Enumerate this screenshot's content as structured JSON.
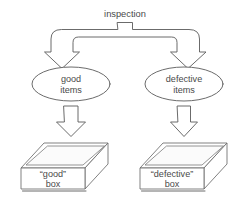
{
  "diagram": {
    "title": "inspection",
    "type": "flow-diagram",
    "colors": {
      "stroke": "#5a5a5a",
      "text": "#4a4a4a",
      "background": "#ffffff"
    },
    "source_node": {
      "label": "inspection",
      "shape": "label-with-tab"
    },
    "split_connector": {
      "name": "split-arrow",
      "branches": 2,
      "direction": "down"
    },
    "branches": [
      {
        "id": "good",
        "ellipse_label_line1": "good",
        "ellipse_label_line2": "items",
        "arrow_direction": "down",
        "box_label_line1": "“good”",
        "box_label_line2": "box"
      },
      {
        "id": "defective",
        "ellipse_label_line1": "defective",
        "ellipse_label_line2": "items",
        "arrow_direction": "down",
        "box_label_line1": "“defective”",
        "box_label_line2": "box"
      }
    ]
  }
}
